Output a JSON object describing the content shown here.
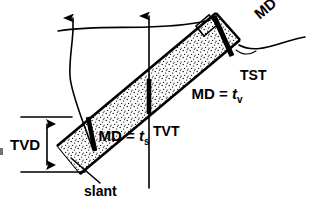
{
  "figure": {
    "background_color": "#ffffff",
    "line_color": "#000000",
    "fill_pattern": "stipple-dots"
  },
  "labels": {
    "tvd": "TVD",
    "tvt": "TVT",
    "tst": "TST",
    "slant": "slant",
    "md_slant": {
      "prefix": "MD = ",
      "symbol": "t",
      "subscript": "s",
      "full": "MD = ts"
    },
    "md_vertical": {
      "prefix": "MD = ",
      "symbol": "t",
      "subscript": "v",
      "full": "MD = tv"
    },
    "md_true": {
      "prefix": "MD = ",
      "symbol": "t",
      "subscript": "",
      "full": "MD = t"
    }
  },
  "elements": {
    "ground_surface": "wavy-ground-line",
    "slant_well": "slant-well-path",
    "vertical_well": "vertical-well-path",
    "bed_upper_boundary": "bed-top-line",
    "bed_lower_boundary": "bed-base-line",
    "tvd_arrow": "tvd-double-arrow",
    "right_angle_marker": "perpendicular-marker",
    "tst_leader": "tst-leader-line",
    "slant_leader": "slant-leader-line"
  },
  "icons": {
    "arrowhead_up": "arrow-up-icon",
    "arrow_double_vertical": "double-arrow-vertical-icon"
  }
}
